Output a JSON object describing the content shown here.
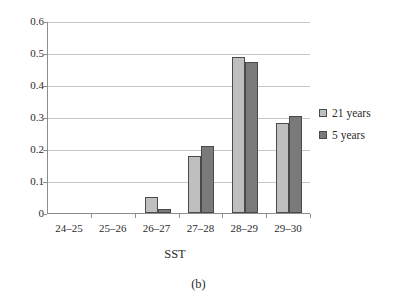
{
  "chart_data": {
    "type": "bar",
    "title": "",
    "subtitle": "",
    "xlabel": "SST",
    "ylabel": "",
    "categories": [
      "24–25",
      "25–26",
      "26–27",
      "27–28",
      "28–29",
      "29–30"
    ],
    "series": [
      {
        "name": "21 years",
        "color": "#bfbfbf",
        "values": [
          0,
          0,
          0.05,
          0.178,
          0.488,
          0.281
        ]
      },
      {
        "name": "5 years",
        "color": "#7a7a7a",
        "values": [
          0,
          0,
          0.012,
          0.209,
          0.473,
          0.303
        ]
      }
    ],
    "ylim": [
      0,
      0.6
    ],
    "ytick_values": [
      0,
      0.1,
      0.2,
      0.3,
      0.4,
      0.5,
      0.6
    ],
    "ytick_labels": [
      "0",
      "0.1",
      "0.2",
      "0.3",
      "0.4",
      "0.5",
      "0.6"
    ],
    "grid": "horizontal",
    "legend_position": "right",
    "caption": "(b)"
  },
  "legend": {
    "entries": [
      {
        "label": "21 years"
      },
      {
        "label": "5 years"
      }
    ]
  },
  "axes": {
    "x_title": "SST",
    "y_title": ""
  },
  "caption": {
    "text": "(b)"
  }
}
